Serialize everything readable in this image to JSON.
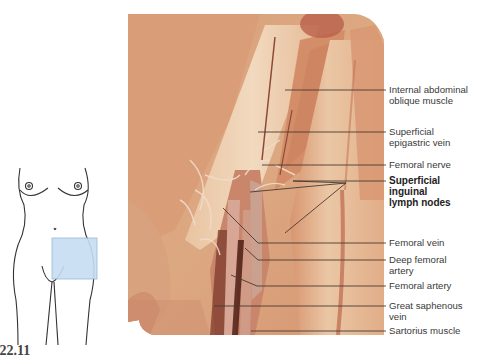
{
  "figure": {
    "number": "22.11",
    "title_partial": ".22.11"
  },
  "orientation_figure": {
    "region_highlight_color": "#c6ddf2",
    "region_highlight_border": "#8fb3d6",
    "outline_color": "#333333",
    "highlight": "inguinal region / upper thigh (right side of figure)"
  },
  "photo": {
    "tissue_base_color": "#d9a07c",
    "light_fascia_color": "#f0d2b4",
    "muscle_color": "#c98561",
    "dark_shadow_color": "#6b2e22",
    "leader_line_color": "#4a3a30"
  },
  "labels": [
    {
      "id": "internal-abdominal-oblique",
      "text": "Internal abdominal\noblique muscle",
      "bold": false,
      "y": 83
    },
    {
      "id": "superficial-epigastric-vein",
      "text": "Superficial\nepigastric vein",
      "bold": false,
      "y": 125
    },
    {
      "id": "femoral-nerve",
      "text": "Femoral nerve",
      "bold": false,
      "y": 160
    },
    {
      "id": "superficial-inguinal-lymph-nodes",
      "text": "Superficial\ninguinal\nlymph nodes",
      "bold": true,
      "y": 177
    },
    {
      "id": "femoral-vein",
      "text": "Femoral vein",
      "bold": false,
      "y": 237
    },
    {
      "id": "deep-femoral-artery",
      "text": "Deep femoral\nartery",
      "bold": false,
      "y": 254
    },
    {
      "id": "femoral-artery",
      "text": "Femoral artery",
      "bold": false,
      "y": 280
    },
    {
      "id": "great-saphenous-vein",
      "text": "Great saphenous\nvein",
      "bold": false,
      "y": 301
    },
    {
      "id": "sartorius-muscle",
      "text": "Sartorius muscle",
      "bold": false,
      "y": 326
    }
  ]
}
